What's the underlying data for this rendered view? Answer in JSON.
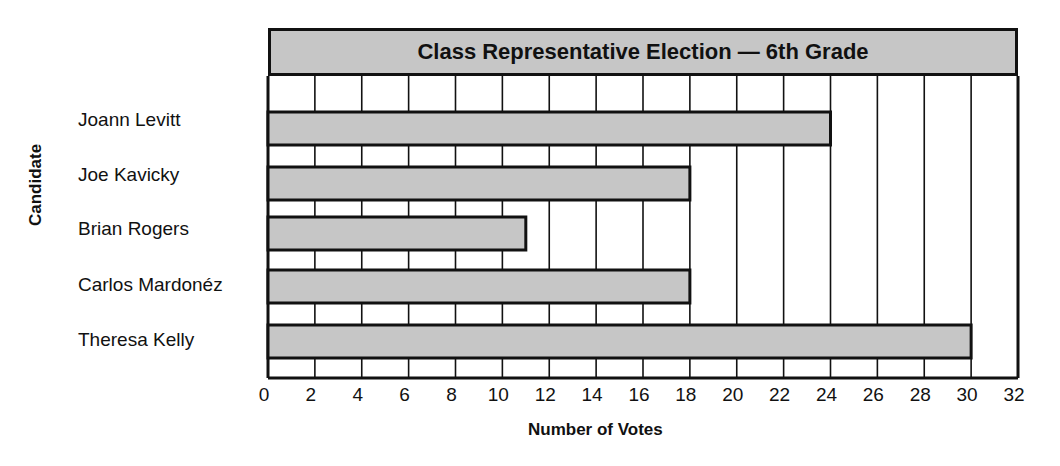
{
  "chart_data": {
    "type": "bar",
    "orientation": "horizontal",
    "title": "Class Representative Election — 6th Grade",
    "xlabel": "Number of Votes",
    "ylabel": "Candidate",
    "categories": [
      "Joann Levitt",
      "Joe Kavicky",
      "Brian Rogers",
      "Carlos Mardonéz",
      "Theresa Kelly"
    ],
    "values": [
      24,
      18,
      11,
      18,
      30
    ],
    "xlim": [
      0,
      32
    ],
    "xticks": [
      "0",
      "2",
      "4",
      "6",
      "8",
      "10",
      "12",
      "14",
      "16",
      "18",
      "20",
      "22",
      "24",
      "26",
      "28",
      "30",
      "32"
    ],
    "grid": "vertical lines every 2",
    "colors": {
      "bar": "#c6c6c6",
      "outline": "#111111",
      "title_band": "#c6c6c6"
    }
  },
  "labels": {
    "title": "Class Representative Election — 6th Grade",
    "xlabel": "Number of Votes",
    "ylabel": "Candidate",
    "candidates": [
      "Joann Levitt",
      "Joe Kavicky",
      "Brian Rogers",
      "Carlos Mardonéz",
      "Theresa Kelly"
    ],
    "ticks": [
      "0",
      "2",
      "4",
      "6",
      "8",
      "10",
      "12",
      "14",
      "16",
      "18",
      "20",
      "22",
      "24",
      "26",
      "28",
      "30",
      "32"
    ]
  }
}
